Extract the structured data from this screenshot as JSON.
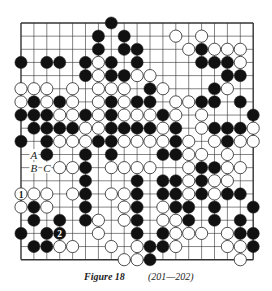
{
  "diagram": {
    "type": "go-board",
    "size": 19,
    "grid": {
      "left": 21,
      "top": 23,
      "dx": 12.9,
      "dy": 13.15
    },
    "colors": {
      "line": "#333333",
      "black": "#111111",
      "white": "#ffffff",
      "stone_outline": "#222222"
    },
    "stones": [
      {
        "r": 0,
        "c": 7,
        "color": "black"
      },
      {
        "r": 1,
        "c": 6,
        "color": "black"
      },
      {
        "r": 1,
        "c": 8,
        "color": "black"
      },
      {
        "r": 1,
        "c": 12,
        "color": "white"
      },
      {
        "r": 1,
        "c": 14,
        "color": "white"
      },
      {
        "r": 2,
        "c": 6,
        "color": "black"
      },
      {
        "r": 2,
        "c": 8,
        "color": "black"
      },
      {
        "r": 2,
        "c": 9,
        "color": "black"
      },
      {
        "r": 2,
        "c": 13,
        "color": "white"
      },
      {
        "r": 2,
        "c": 14,
        "color": "black"
      },
      {
        "r": 2,
        "c": 15,
        "color": "white"
      },
      {
        "r": 2,
        "c": 16,
        "color": "white"
      },
      {
        "r": 2,
        "c": 17,
        "color": "white"
      },
      {
        "r": 3,
        "c": 0,
        "color": "black"
      },
      {
        "r": 3,
        "c": 2,
        "color": "black"
      },
      {
        "r": 3,
        "c": 3,
        "color": "black"
      },
      {
        "r": 3,
        "c": 5,
        "color": "black"
      },
      {
        "r": 3,
        "c": 6,
        "color": "white"
      },
      {
        "r": 3,
        "c": 7,
        "color": "black"
      },
      {
        "r": 3,
        "c": 9,
        "color": "black"
      },
      {
        "r": 3,
        "c": 14,
        "color": "black"
      },
      {
        "r": 3,
        "c": 15,
        "color": "black"
      },
      {
        "r": 3,
        "c": 16,
        "color": "black"
      },
      {
        "r": 3,
        "c": 17,
        "color": "white"
      },
      {
        "r": 4,
        "c": 5,
        "color": "black"
      },
      {
        "r": 4,
        "c": 6,
        "color": "white"
      },
      {
        "r": 4,
        "c": 7,
        "color": "black"
      },
      {
        "r": 4,
        "c": 8,
        "color": "black"
      },
      {
        "r": 4,
        "c": 9,
        "color": "white"
      },
      {
        "r": 4,
        "c": 10,
        "color": "white"
      },
      {
        "r": 4,
        "c": 16,
        "color": "black"
      },
      {
        "r": 4,
        "c": 17,
        "color": "black"
      },
      {
        "r": 5,
        "c": 0,
        "color": "white"
      },
      {
        "r": 5,
        "c": 1,
        "color": "white"
      },
      {
        "r": 5,
        "c": 2,
        "color": "white"
      },
      {
        "r": 5,
        "c": 4,
        "color": "white"
      },
      {
        "r": 5,
        "c": 6,
        "color": "white"
      },
      {
        "r": 5,
        "c": 7,
        "color": "white"
      },
      {
        "r": 5,
        "c": 8,
        "color": "white"
      },
      {
        "r": 5,
        "c": 10,
        "color": "black"
      },
      {
        "r": 5,
        "c": 11,
        "color": "white"
      },
      {
        "r": 5,
        "c": 15,
        "color": "black"
      },
      {
        "r": 5,
        "c": 16,
        "color": "white"
      },
      {
        "r": 6,
        "c": 0,
        "color": "white"
      },
      {
        "r": 6,
        "c": 1,
        "color": "black"
      },
      {
        "r": 6,
        "c": 2,
        "color": "white"
      },
      {
        "r": 6,
        "c": 3,
        "color": "black"
      },
      {
        "r": 6,
        "c": 4,
        "color": "white"
      },
      {
        "r": 6,
        "c": 6,
        "color": "white"
      },
      {
        "r": 6,
        "c": 7,
        "color": "black"
      },
      {
        "r": 6,
        "c": 8,
        "color": "white"
      },
      {
        "r": 6,
        "c": 9,
        "color": "black"
      },
      {
        "r": 6,
        "c": 10,
        "color": "black"
      },
      {
        "r": 6,
        "c": 12,
        "color": "white"
      },
      {
        "r": 6,
        "c": 13,
        "color": "white"
      },
      {
        "r": 6,
        "c": 14,
        "color": "black"
      },
      {
        "r": 6,
        "c": 15,
        "color": "black"
      },
      {
        "r": 6,
        "c": 17,
        "color": "black"
      },
      {
        "r": 7,
        "c": 0,
        "color": "black"
      },
      {
        "r": 7,
        "c": 1,
        "color": "black"
      },
      {
        "r": 7,
        "c": 2,
        "color": "black"
      },
      {
        "r": 7,
        "c": 3,
        "color": "white"
      },
      {
        "r": 7,
        "c": 4,
        "color": "white"
      },
      {
        "r": 7,
        "c": 5,
        "color": "black"
      },
      {
        "r": 7,
        "c": 6,
        "color": "white"
      },
      {
        "r": 7,
        "c": 7,
        "color": "black"
      },
      {
        "r": 7,
        "c": 8,
        "color": "white"
      },
      {
        "r": 7,
        "c": 9,
        "color": "white"
      },
      {
        "r": 7,
        "c": 10,
        "color": "white"
      },
      {
        "r": 7,
        "c": 11,
        "color": "black"
      },
      {
        "r": 7,
        "c": 12,
        "color": "white"
      },
      {
        "r": 7,
        "c": 14,
        "color": "white"
      },
      {
        "r": 7,
        "c": 18,
        "color": "black"
      },
      {
        "r": 8,
        "c": 1,
        "color": "black"
      },
      {
        "r": 8,
        "c": 2,
        "color": "black"
      },
      {
        "r": 8,
        "c": 3,
        "color": "black"
      },
      {
        "r": 8,
        "c": 4,
        "color": "black"
      },
      {
        "r": 8,
        "c": 5,
        "color": "white"
      },
      {
        "r": 8,
        "c": 6,
        "color": "white"
      },
      {
        "r": 8,
        "c": 7,
        "color": "black"
      },
      {
        "r": 8,
        "c": 8,
        "color": "black"
      },
      {
        "r": 8,
        "c": 9,
        "color": "black"
      },
      {
        "r": 8,
        "c": 10,
        "color": "black"
      },
      {
        "r": 8,
        "c": 11,
        "color": "white"
      },
      {
        "r": 8,
        "c": 12,
        "color": "black"
      },
      {
        "r": 8,
        "c": 14,
        "color": "white"
      },
      {
        "r": 8,
        "c": 15,
        "color": "black"
      },
      {
        "r": 8,
        "c": 16,
        "color": "black"
      },
      {
        "r": 8,
        "c": 17,
        "color": "black"
      },
      {
        "r": 8,
        "c": 18,
        "color": "white"
      },
      {
        "r": 9,
        "c": 0,
        "color": "black"
      },
      {
        "r": 9,
        "c": 2,
        "color": "black"
      },
      {
        "r": 9,
        "c": 3,
        "color": "white"
      },
      {
        "r": 9,
        "c": 4,
        "color": "white"
      },
      {
        "r": 9,
        "c": 5,
        "color": "white"
      },
      {
        "r": 9,
        "c": 6,
        "color": "black"
      },
      {
        "r": 9,
        "c": 7,
        "color": "black"
      },
      {
        "r": 9,
        "c": 8,
        "color": "white"
      },
      {
        "r": 9,
        "c": 9,
        "color": "white"
      },
      {
        "r": 9,
        "c": 10,
        "color": "white"
      },
      {
        "r": 9,
        "c": 11,
        "color": "white"
      },
      {
        "r": 9,
        "c": 12,
        "color": "black"
      },
      {
        "r": 9,
        "c": 13,
        "color": "white"
      },
      {
        "r": 9,
        "c": 15,
        "color": "white"
      },
      {
        "r": 9,
        "c": 16,
        "color": "black"
      },
      {
        "r": 9,
        "c": 17,
        "color": "white"
      },
      {
        "r": 9,
        "c": 18,
        "color": "white"
      },
      {
        "r": 10,
        "c": 2,
        "color": "black"
      },
      {
        "r": 10,
        "c": 5,
        "color": "black"
      },
      {
        "r": 10,
        "c": 7,
        "color": "black"
      },
      {
        "r": 10,
        "c": 11,
        "color": "black"
      },
      {
        "r": 10,
        "c": 12,
        "color": "black"
      },
      {
        "r": 10,
        "c": 13,
        "color": "white"
      },
      {
        "r": 10,
        "c": 14,
        "color": "white"
      },
      {
        "r": 10,
        "c": 16,
        "color": "white"
      },
      {
        "r": 11,
        "c": 3,
        "color": "white"
      },
      {
        "r": 11,
        "c": 4,
        "color": "white"
      },
      {
        "r": 11,
        "c": 5,
        "color": "black"
      },
      {
        "r": 11,
        "c": 7,
        "color": "white"
      },
      {
        "r": 11,
        "c": 8,
        "color": "white"
      },
      {
        "r": 11,
        "c": 9,
        "color": "white"
      },
      {
        "r": 11,
        "c": 10,
        "color": "white"
      },
      {
        "r": 11,
        "c": 13,
        "color": "white"
      },
      {
        "r": 11,
        "c": 14,
        "color": "black"
      },
      {
        "r": 11,
        "c": 15,
        "color": "black"
      },
      {
        "r": 11,
        "c": 16,
        "color": "white"
      },
      {
        "r": 11,
        "c": 17,
        "color": "white"
      },
      {
        "r": 12,
        "c": 5,
        "color": "black"
      },
      {
        "r": 12,
        "c": 9,
        "color": "black"
      },
      {
        "r": 12,
        "c": 11,
        "color": "black"
      },
      {
        "r": 12,
        "c": 12,
        "color": "black"
      },
      {
        "r": 12,
        "c": 13,
        "color": "white"
      },
      {
        "r": 12,
        "c": 14,
        "color": "black"
      },
      {
        "r": 12,
        "c": 15,
        "color": "white"
      },
      {
        "r": 12,
        "c": 16,
        "color": "white"
      },
      {
        "r": 13,
        "c": 0,
        "color": "white",
        "label": "1"
      },
      {
        "r": 13,
        "c": 1,
        "color": "white"
      },
      {
        "r": 13,
        "c": 2,
        "color": "white"
      },
      {
        "r": 13,
        "c": 4,
        "color": "white"
      },
      {
        "r": 13,
        "c": 5,
        "color": "black"
      },
      {
        "r": 13,
        "c": 7,
        "color": "white"
      },
      {
        "r": 13,
        "c": 8,
        "color": "white"
      },
      {
        "r": 13,
        "c": 9,
        "color": "black"
      },
      {
        "r": 13,
        "c": 11,
        "color": "black"
      },
      {
        "r": 13,
        "c": 12,
        "color": "black"
      },
      {
        "r": 13,
        "c": 13,
        "color": "white"
      },
      {
        "r": 13,
        "c": 14,
        "color": "black"
      },
      {
        "r": 13,
        "c": 15,
        "color": "white"
      },
      {
        "r": 13,
        "c": 16,
        "color": "black"
      },
      {
        "r": 13,
        "c": 17,
        "color": "black"
      },
      {
        "r": 14,
        "c": 0,
        "color": "white"
      },
      {
        "r": 14,
        "c": 1,
        "color": "black"
      },
      {
        "r": 14,
        "c": 2,
        "color": "white"
      },
      {
        "r": 14,
        "c": 5,
        "color": "black"
      },
      {
        "r": 14,
        "c": 8,
        "color": "white"
      },
      {
        "r": 14,
        "c": 9,
        "color": "black"
      },
      {
        "r": 14,
        "c": 11,
        "color": "white"
      },
      {
        "r": 14,
        "c": 12,
        "color": "black"
      },
      {
        "r": 14,
        "c": 13,
        "color": "black"
      },
      {
        "r": 14,
        "c": 15,
        "color": "black"
      },
      {
        "r": 14,
        "c": 18,
        "color": "black"
      },
      {
        "r": 15,
        "c": 1,
        "color": "black"
      },
      {
        "r": 15,
        "c": 3,
        "color": "black"
      },
      {
        "r": 15,
        "c": 5,
        "color": "black"
      },
      {
        "r": 15,
        "c": 6,
        "color": "white"
      },
      {
        "r": 15,
        "c": 8,
        "color": "white"
      },
      {
        "r": 15,
        "c": 9,
        "color": "black"
      },
      {
        "r": 15,
        "c": 11,
        "color": "white"
      },
      {
        "r": 15,
        "c": 12,
        "color": "white"
      },
      {
        "r": 15,
        "c": 13,
        "color": "black"
      },
      {
        "r": 15,
        "c": 15,
        "color": "black"
      },
      {
        "r": 15,
        "c": 17,
        "color": "black"
      },
      {
        "r": 16,
        "c": 0,
        "color": "black"
      },
      {
        "r": 16,
        "c": 2,
        "color": "black"
      },
      {
        "r": 16,
        "c": 3,
        "color": "black",
        "label": "2"
      },
      {
        "r": 16,
        "c": 6,
        "color": "white"
      },
      {
        "r": 16,
        "c": 9,
        "color": "black"
      },
      {
        "r": 16,
        "c": 11,
        "color": "black"
      },
      {
        "r": 16,
        "c": 12,
        "color": "white"
      },
      {
        "r": 16,
        "c": 13,
        "color": "white"
      },
      {
        "r": 16,
        "c": 14,
        "color": "white"
      },
      {
        "r": 16,
        "c": 16,
        "color": "white"
      },
      {
        "r": 16,
        "c": 17,
        "color": "black"
      },
      {
        "r": 16,
        "c": 18,
        "color": "black"
      },
      {
        "r": 17,
        "c": 1,
        "color": "black"
      },
      {
        "r": 17,
        "c": 2,
        "color": "black"
      },
      {
        "r": 17,
        "c": 3,
        "color": "white"
      },
      {
        "r": 17,
        "c": 4,
        "color": "white"
      },
      {
        "r": 17,
        "c": 7,
        "color": "white"
      },
      {
        "r": 17,
        "c": 9,
        "color": "white"
      },
      {
        "r": 17,
        "c": 10,
        "color": "black"
      },
      {
        "r": 17,
        "c": 11,
        "color": "black"
      },
      {
        "r": 17,
        "c": 12,
        "color": "white"
      },
      {
        "r": 17,
        "c": 16,
        "color": "white"
      },
      {
        "r": 17,
        "c": 17,
        "color": "white"
      },
      {
        "r": 17,
        "c": 18,
        "color": "black"
      },
      {
        "r": 18,
        "c": 8,
        "color": "white"
      },
      {
        "r": 18,
        "c": 9,
        "color": "white"
      },
      {
        "r": 18,
        "c": 10,
        "color": "black"
      },
      {
        "r": 18,
        "c": 17,
        "color": "white"
      }
    ],
    "point_labels": [
      {
        "r": 10,
        "c": 1,
        "text": "A"
      },
      {
        "r": 11,
        "c": 1,
        "text": "B"
      },
      {
        "r": 11,
        "c": 2,
        "text": "C"
      }
    ]
  },
  "caption": {
    "figure": "Figure 18",
    "moves": "(201—202)"
  }
}
